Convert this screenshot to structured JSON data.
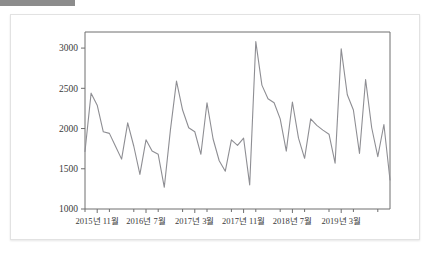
{
  "window": {
    "top_bar_color": "#8c8c8c",
    "card_background": "#ffffff",
    "card_border_color": "#e2e2e2"
  },
  "chart_data": {
    "type": "line",
    "title": "",
    "subtitle": "",
    "xlabel": "",
    "ylabel": "",
    "line_color": "#8e8e93",
    "axis_color": "#6e6e6e",
    "grid": false,
    "legend": null,
    "legend_position": "none",
    "ylim": [
      1000,
      3200
    ],
    "yticks": [
      1000,
      1500,
      2000,
      2500,
      3000
    ],
    "ytick_labels": [
      "1000",
      "1500",
      "2000",
      "2500",
      "3000"
    ],
    "xtick_labels": [
      "2015년 11월",
      "2016년 7월",
      "2017년 3월",
      "2017년 11월",
      "2018년 7월",
      "2019년 3월"
    ],
    "xtick_indices": [
      2,
      10,
      18,
      26,
      34,
      42
    ],
    "x": [
      "2015년 9월",
      "2015년 10월",
      "2015년 11월",
      "2015년 12월",
      "2016년 1월",
      "2016년 2월",
      "2016년 3월",
      "2016년 4월",
      "2016년 5월",
      "2016년 6월",
      "2016년 7월",
      "2016년 8월",
      "2016년 9월",
      "2016년 10월",
      "2016년 11월",
      "2016년 12월",
      "2017년 1월",
      "2017년 2월",
      "2017년 3월",
      "2017년 4월",
      "2017년 5월",
      "2017년 6월",
      "2017년 7월",
      "2017년 8월",
      "2017년 9월",
      "2017년 10월",
      "2017년 11월",
      "2017년 12월",
      "2018년 1월",
      "2018년 2월",
      "2018년 3월",
      "2018년 4월",
      "2018년 5월",
      "2018년 6월",
      "2018년 7월",
      "2018년 8월",
      "2018년 9월",
      "2018년 10월",
      "2018년 11월",
      "2018년 12월",
      "2019년 1월",
      "2019년 2월",
      "2019년 3월",
      "2019년 4월",
      "2019년 5월",
      "2019년 6월",
      "2019년 7월",
      "2019년 8월",
      "2019년 9월",
      "2019년 10월",
      "2019년 11월"
    ],
    "values": [
      1715,
      2440,
      2290,
      1960,
      1940,
      1780,
      1620,
      2070,
      1780,
      1430,
      1860,
      1720,
      1680,
      1270,
      1980,
      2590,
      2230,
      2010,
      1960,
      1680,
      2320,
      1870,
      1600,
      1470,
      1860,
      1790,
      1880,
      1300,
      3080,
      2540,
      2370,
      2320,
      2120,
      1720,
      2330,
      1880,
      1630,
      2120,
      2040,
      1980,
      1930,
      1570,
      2990,
      2420,
      2230,
      1690,
      2610,
      2010,
      1650,
      2050,
      1360
    ]
  }
}
